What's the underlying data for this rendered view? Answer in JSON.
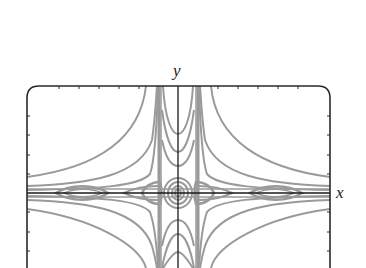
{
  "figure": {
    "type": "phase-portrait-contour-plot",
    "axes": {
      "x_label": "x",
      "y_label": "y",
      "tick_labels_visible": false
    },
    "colors": {
      "curve": "#9a9a9a",
      "axis": "#1a1a1a",
      "frame": "#2a2a2a",
      "background": "#ffffff"
    },
    "features": [
      "center-concentric-ellipses-at-origin",
      "two-vertical-separatrix-bands",
      "horizontal-band-along-x-axis",
      "hyperbola-like-level-curves-in-four-quadrants",
      "lens-shaped-closed-orbits-on-x-axis"
    ]
  }
}
